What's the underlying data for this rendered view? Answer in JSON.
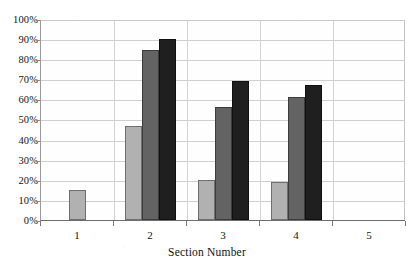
{
  "chart_data": {
    "type": "bar",
    "title": "",
    "xlabel": "Section Number",
    "ylabel": "",
    "categories": [
      "1",
      "2",
      "3",
      "4",
      "5"
    ],
    "series": [
      {
        "name": "series-1",
        "color": "#b1b1b1",
        "values": [
          15,
          47,
          20,
          19,
          null
        ]
      },
      {
        "name": "series-2",
        "color": "#636363",
        "values": [
          null,
          84.5,
          56,
          61,
          null
        ]
      },
      {
        "name": "series-3",
        "color": "#1f1f1f",
        "values": [
          null,
          90,
          69,
          67,
          null
        ]
      }
    ],
    "ylim": [
      0,
      100
    ],
    "ytick_labels": [
      "100%",
      "90%",
      "80%",
      "70%",
      "60%",
      "50%",
      "40%",
      "30%",
      "20%",
      "10%",
      "0%"
    ],
    "ytick_values": [
      100,
      90,
      80,
      70,
      60,
      50,
      40,
      30,
      20,
      10,
      0
    ],
    "grid": true,
    "legend": "none"
  }
}
